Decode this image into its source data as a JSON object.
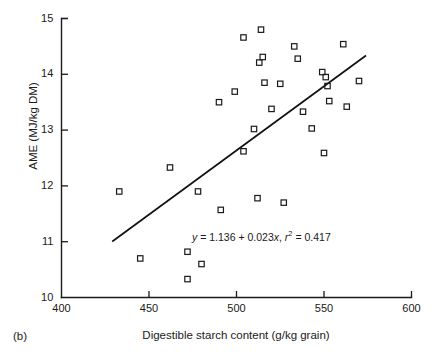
{
  "figure": {
    "panel_label": "(b)",
    "annotation": {
      "y_symbol": "y",
      "eq_body": " = 1.136 + 0.023",
      "x_symbol": "x",
      "separator": ", ",
      "r_symbol": "r",
      "r_exponent": "2",
      "r_value": " = 0.417",
      "full_text": "y = 1.136 + 0.023x, r2 = 0.417"
    }
  },
  "chart_data": {
    "type": "scatter",
    "title": "",
    "xlabel": "Digestible starch content (g/kg grain)",
    "ylabel": "AME (MJ/kg DM)",
    "xlim": [
      400,
      600
    ],
    "ylim": [
      10,
      15
    ],
    "xticks": [
      400,
      450,
      500,
      550,
      600
    ],
    "yticks": [
      10,
      11,
      12,
      13,
      14,
      15
    ],
    "xtick_labels": [
      "400",
      "450",
      "500",
      "550",
      "600"
    ],
    "ytick_labels": [
      "10",
      "11",
      "12",
      "13",
      "14",
      "15"
    ],
    "grid": false,
    "legend": null,
    "marker": "open-square",
    "points": [
      {
        "x": 433,
        "y": 11.9
      },
      {
        "x": 445,
        "y": 10.7
      },
      {
        "x": 462,
        "y": 12.33
      },
      {
        "x": 472,
        "y": 10.82
      },
      {
        "x": 472,
        "y": 10.33
      },
      {
        "x": 478,
        "y": 11.9
      },
      {
        "x": 480,
        "y": 10.6
      },
      {
        "x": 490,
        "y": 13.5
      },
      {
        "x": 491,
        "y": 11.57
      },
      {
        "x": 499,
        "y": 13.69
      },
      {
        "x": 504,
        "y": 14.66
      },
      {
        "x": 504,
        "y": 12.62
      },
      {
        "x": 510,
        "y": 13.02
      },
      {
        "x": 512,
        "y": 11.78
      },
      {
        "x": 513,
        "y": 14.21
      },
      {
        "x": 514,
        "y": 14.8
      },
      {
        "x": 515,
        "y": 14.31
      },
      {
        "x": 516,
        "y": 13.85
      },
      {
        "x": 520,
        "y": 13.38
      },
      {
        "x": 525,
        "y": 13.83
      },
      {
        "x": 527,
        "y": 11.7
      },
      {
        "x": 533,
        "y": 14.5
      },
      {
        "x": 535,
        "y": 14.28
      },
      {
        "x": 538,
        "y": 13.33
      },
      {
        "x": 543,
        "y": 13.03
      },
      {
        "x": 549,
        "y": 14.04
      },
      {
        "x": 550,
        "y": 12.59
      },
      {
        "x": 551,
        "y": 13.95
      },
      {
        "x": 552,
        "y": 13.79
      },
      {
        "x": 553,
        "y": 13.52
      },
      {
        "x": 561,
        "y": 14.54
      },
      {
        "x": 563,
        "y": 13.42
      },
      {
        "x": 570,
        "y": 13.88
      }
    ],
    "fit_line": {
      "equation": "y = 1.136 + 0.023x",
      "intercept": 1.136,
      "slope": 0.023,
      "r_squared": 0.417,
      "x_start": 429,
      "x_end": 574
    }
  }
}
